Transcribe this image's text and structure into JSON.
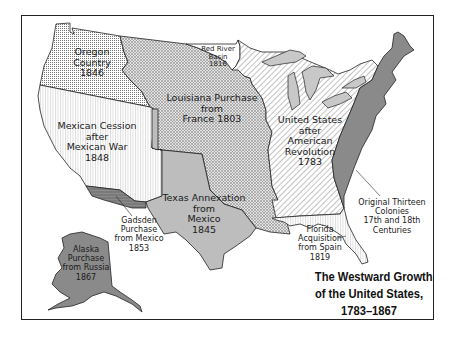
{
  "map": {
    "title_lines": [
      "The Westward Growth",
      "of the United States,",
      "1783–1867"
    ],
    "colors": {
      "frame": "#222222",
      "original_colonies": "#8a8a8a",
      "texas": "#bdbdbd",
      "gadsden": "#7a7a7a",
      "alaska": "#8a8a8a",
      "great_lakes": "#c8c8c8",
      "pattern_ink": "#555555"
    },
    "regions": [
      {
        "id": "oregon",
        "label": "Oregon\nCountry\n1846",
        "pattern": "dots"
      },
      {
        "id": "mexican-cession",
        "label": "Mexican Cession\nafter\nMexican War\n1848",
        "pattern": "vertical-lines"
      },
      {
        "id": "louisiana",
        "label": "Louisiana Purchase\nfrom\nFrance 1803",
        "pattern": "crosshatch"
      },
      {
        "id": "red-river",
        "label": "Red River\nBasin\n1816",
        "pattern": "none"
      },
      {
        "id": "us-1783",
        "label": "United States\nafter\nAmerican\nRevolution\n1783",
        "pattern": "diagonal-lines"
      },
      {
        "id": "original-colonies",
        "label": "Original Thirteen\nColonies\n17th and 18th\nCenturies",
        "pattern": "solid-dark"
      },
      {
        "id": "texas",
        "label": "Texas Annexation\nfrom\nMexico\n1845",
        "pattern": "solid-light"
      },
      {
        "id": "gadsden",
        "label": "Gadsden\nPurchase\nfrom Mexico\n1853",
        "pattern": "solid-dark-lines"
      },
      {
        "id": "florida",
        "label": "Florida\nAcquisition\nfrom Spain\n1819",
        "pattern": "vertical-lines"
      },
      {
        "id": "alaska",
        "label": "Alaska\nPurchase\nfrom Russia\n1867",
        "pattern": "solid-dark"
      }
    ]
  }
}
